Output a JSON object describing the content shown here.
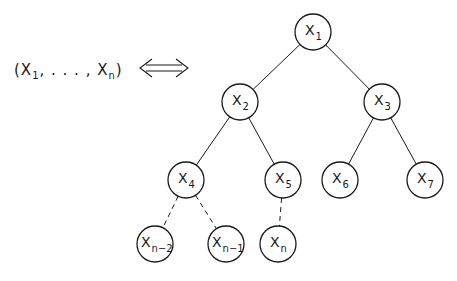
{
  "tuple": {
    "open": "(",
    "first_var": "X",
    "first_sub": "1",
    "ellipsis": ", . . . ,",
    "last_var": "X",
    "last_sub": "n",
    "close": ")"
  },
  "equivalence_symbol": "⟺",
  "tree": {
    "nodes": [
      {
        "id": "x1",
        "var": "X",
        "sub": "1",
        "cx": 313,
        "cy": 32
      },
      {
        "id": "x2",
        "var": "X",
        "sub": "2",
        "cx": 240,
        "cy": 102
      },
      {
        "id": "x3",
        "var": "X",
        "sub": "3",
        "cx": 382,
        "cy": 102
      },
      {
        "id": "x4",
        "var": "X",
        "sub": "4",
        "cx": 186,
        "cy": 180
      },
      {
        "id": "x5",
        "var": "X",
        "sub": "5",
        "cx": 283,
        "cy": 180
      },
      {
        "id": "x6",
        "var": "X",
        "sub": "6",
        "cx": 340,
        "cy": 180
      },
      {
        "id": "x7",
        "var": "X",
        "sub": "7",
        "cx": 425,
        "cy": 180
      },
      {
        "id": "xn2",
        "var": "X",
        "sub": "n−2",
        "cx": 155,
        "cy": 244
      },
      {
        "id": "xn1",
        "var": "X",
        "sub": "n−1",
        "cx": 226,
        "cy": 244
      },
      {
        "id": "xn",
        "var": "X",
        "sub": "n",
        "cx": 278,
        "cy": 244
      }
    ],
    "edges": [
      {
        "from": "x1",
        "to": "x2",
        "style": "solid"
      },
      {
        "from": "x1",
        "to": "x3",
        "style": "solid"
      },
      {
        "from": "x2",
        "to": "x4",
        "style": "solid"
      },
      {
        "from": "x2",
        "to": "x5",
        "style": "solid"
      },
      {
        "from": "x3",
        "to": "x6",
        "style": "solid"
      },
      {
        "from": "x3",
        "to": "x7",
        "style": "solid"
      },
      {
        "from": "x4",
        "to": "xn2",
        "style": "dashed"
      },
      {
        "from": "x4",
        "to": "xn1",
        "style": "dashed"
      },
      {
        "from": "x5",
        "to": "xn",
        "style": "dashed"
      }
    ]
  }
}
